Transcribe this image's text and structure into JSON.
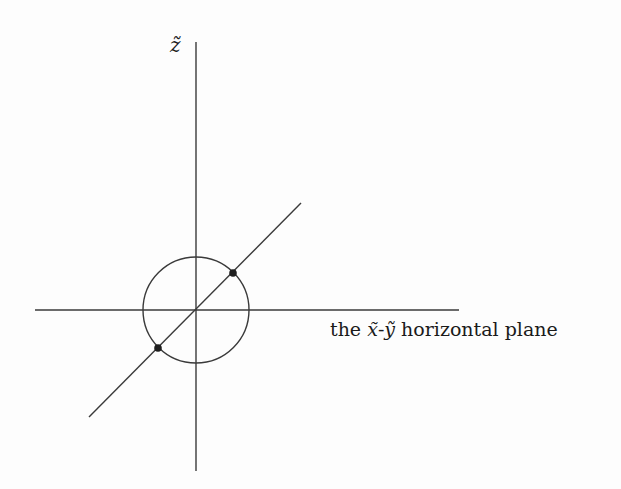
{
  "diagram": {
    "type": "3d-axes-with-circle",
    "vertical_axis": {
      "label": "z̃",
      "x": 196,
      "y_top": 42,
      "y_bottom": 471
    },
    "horizontal_axis": {
      "y": 310,
      "x_left": 35,
      "x_right": 459
    },
    "diagonal_axis": {
      "x1": 89,
      "y1": 417,
      "x2": 301,
      "y2": 203
    },
    "circle": {
      "cx": 196,
      "cy": 310,
      "r": 53
    },
    "points": [
      {
        "name": "upper-right-intersection",
        "cx": 233,
        "cy": 273,
        "r": 3.8
      },
      {
        "name": "lower-left-intersection",
        "cx": 158,
        "cy": 348,
        "r": 3.8
      }
    ],
    "plane_label": {
      "prefix": "the ",
      "x_var": "x̃",
      "dash": "-",
      "y_var": "ỹ",
      "suffix": " horizontal plane"
    },
    "colors": {
      "line": "#3a3a3a",
      "point": "#1e1e1e",
      "background": "#fdfdfd"
    }
  }
}
